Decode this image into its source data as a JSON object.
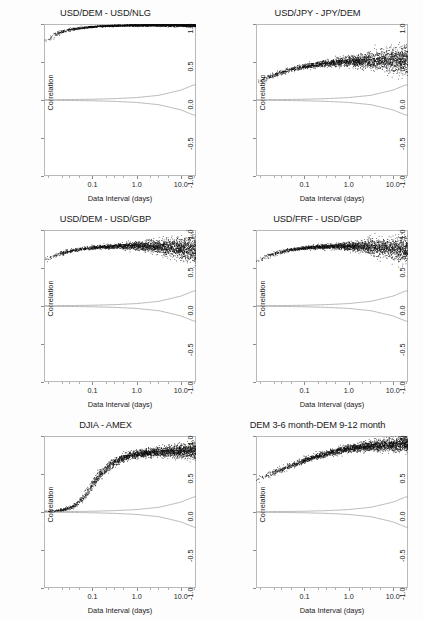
{
  "figure": {
    "background": "#fdfdfd",
    "point_color": "#0d0d0d",
    "band_color": "#9a9a9a",
    "layout": "3 rows x 2 columns"
  },
  "axes": {
    "xlabel": "Data Interval (days)",
    "ylabel": "Correlation",
    "x_scale": "log",
    "x_ticks": [
      {
        "value": 0.1,
        "label": "0.1"
      },
      {
        "value": 1.0,
        "label": "1.0"
      },
      {
        "value": 10.0,
        "label": "10.0"
      }
    ],
    "xlim": [
      0.008,
      22
    ],
    "y_ticks": [
      {
        "value": 1.0,
        "label": "1.0"
      },
      {
        "value": 0.5,
        "label": "0.5"
      },
      {
        "value": 0.0,
        "label": "0.0"
      },
      {
        "value": -0.5,
        "label": "-0.5"
      },
      {
        "value": -1.0,
        "label": "-1.0"
      }
    ],
    "ylim": [
      -1.0,
      1.0
    ],
    "grid": false,
    "legend": "none"
  },
  "chart_data": [
    {
      "type": "scatter",
      "title": "USD/DEM - USD/NLG",
      "xlabel": "Data Interval (days)",
      "ylabel": "Correlation",
      "xscale": "log",
      "xlim": [
        0.008,
        22
      ],
      "ylim": [
        -1.0,
        1.0
      ],
      "grid": false,
      "series": [
        {
          "name": "correlation",
          "x": [
            0.01,
            0.014,
            0.02,
            0.028,
            0.04,
            0.056,
            0.08,
            0.11,
            0.16,
            0.22,
            0.32,
            0.45,
            0.63,
            0.9,
            1.3,
            1.8,
            2.5,
            3.6,
            5.0,
            7.1,
            10.0,
            14.0,
            20.0
          ],
          "y": [
            0.8,
            0.855,
            0.893,
            0.918,
            0.936,
            0.949,
            0.958,
            0.965,
            0.97,
            0.974,
            0.977,
            0.979,
            0.981,
            0.982,
            0.983,
            0.984,
            0.985,
            0.985,
            0.986,
            0.986,
            0.986,
            0.986,
            0.986
          ],
          "spread": [
            0.035,
            0.028,
            0.022,
            0.018,
            0.014,
            0.012,
            0.01,
            0.009,
            0.008,
            0.008,
            0.008,
            0.008,
            0.009,
            0.009,
            0.01,
            0.011,
            0.012,
            0.013,
            0.014,
            0.016,
            0.018,
            0.02,
            0.022
          ]
        },
        {
          "name": "upper-confidence-band",
          "x": [
            0.01,
            0.032,
            0.1,
            0.32,
            1.0,
            3.2,
            10.0,
            20.0
          ],
          "y": [
            0.004,
            0.006,
            0.01,
            0.018,
            0.032,
            0.062,
            0.13,
            0.2
          ]
        },
        {
          "name": "lower-confidence-band",
          "x": [
            0.01,
            0.032,
            0.1,
            0.32,
            1.0,
            3.2,
            10.0,
            20.0
          ],
          "y": [
            -0.004,
            -0.006,
            -0.01,
            -0.018,
            -0.032,
            -0.062,
            -0.13,
            -0.2
          ]
        }
      ]
    },
    {
      "type": "scatter",
      "title": "USD/JPY - JPY/DEM",
      "xlabel": "Data Interval (days)",
      "ylabel": "Correlation",
      "xscale": "log",
      "xlim": [
        0.008,
        22
      ],
      "ylim": [
        -1.0,
        1.0
      ],
      "grid": false,
      "series": [
        {
          "name": "correlation",
          "x": [
            0.01,
            0.014,
            0.02,
            0.028,
            0.04,
            0.056,
            0.08,
            0.11,
            0.16,
            0.22,
            0.32,
            0.45,
            0.63,
            0.9,
            1.3,
            1.8,
            2.5,
            3.6,
            5.0,
            7.1,
            10.0,
            14.0,
            20.0
          ],
          "y": [
            0.25,
            0.29,
            0.325,
            0.356,
            0.383,
            0.407,
            0.428,
            0.445,
            0.46,
            0.472,
            0.482,
            0.49,
            0.497,
            0.502,
            0.506,
            0.51,
            0.513,
            0.516,
            0.519,
            0.522,
            0.525,
            0.528,
            0.53
          ],
          "spread": [
            0.03,
            0.028,
            0.027,
            0.026,
            0.026,
            0.026,
            0.027,
            0.028,
            0.03,
            0.033,
            0.036,
            0.04,
            0.045,
            0.051,
            0.058,
            0.066,
            0.075,
            0.085,
            0.096,
            0.108,
            0.12,
            0.133,
            0.145
          ]
        },
        {
          "name": "upper-confidence-band",
          "x": [
            0.01,
            0.032,
            0.1,
            0.32,
            1.0,
            3.2,
            10.0,
            20.0
          ],
          "y": [
            0.004,
            0.006,
            0.01,
            0.018,
            0.032,
            0.062,
            0.13,
            0.2
          ]
        },
        {
          "name": "lower-confidence-band",
          "x": [
            0.01,
            0.032,
            0.1,
            0.32,
            1.0,
            3.2,
            10.0,
            20.0
          ],
          "y": [
            -0.004,
            -0.006,
            -0.01,
            -0.018,
            -0.032,
            -0.062,
            -0.13,
            -0.2
          ]
        }
      ]
    },
    {
      "type": "scatter",
      "title": "USD/DEM - USD/GBP",
      "xlabel": "Data Interval (days)",
      "ylabel": "Correlation",
      "xscale": "log",
      "xlim": [
        0.008,
        22
      ],
      "ylim": [
        -1.0,
        1.0
      ],
      "grid": false,
      "series": [
        {
          "name": "correlation",
          "x": [
            0.01,
            0.014,
            0.02,
            0.028,
            0.04,
            0.056,
            0.08,
            0.11,
            0.16,
            0.22,
            0.32,
            0.45,
            0.63,
            0.9,
            1.3,
            1.8,
            2.5,
            3.6,
            5.0,
            7.1,
            10.0,
            14.0,
            20.0
          ],
          "y": [
            0.62,
            0.66,
            0.69,
            0.714,
            0.733,
            0.748,
            0.76,
            0.769,
            0.776,
            0.781,
            0.785,
            0.787,
            0.788,
            0.788,
            0.787,
            0.785,
            0.782,
            0.778,
            0.773,
            0.767,
            0.76,
            0.752,
            0.743
          ],
          "spread": [
            0.028,
            0.025,
            0.022,
            0.02,
            0.019,
            0.018,
            0.018,
            0.019,
            0.02,
            0.022,
            0.025,
            0.029,
            0.034,
            0.04,
            0.047,
            0.055,
            0.064,
            0.074,
            0.085,
            0.097,
            0.11,
            0.124,
            0.138
          ]
        },
        {
          "name": "upper-confidence-band",
          "x": [
            0.01,
            0.032,
            0.1,
            0.32,
            1.0,
            3.2,
            10.0,
            20.0
          ],
          "y": [
            0.004,
            0.006,
            0.01,
            0.018,
            0.032,
            0.062,
            0.13,
            0.2
          ]
        },
        {
          "name": "lower-confidence-band",
          "x": [
            0.01,
            0.032,
            0.1,
            0.32,
            1.0,
            3.2,
            10.0,
            20.0
          ],
          "y": [
            -0.004,
            -0.006,
            -0.01,
            -0.018,
            -0.032,
            -0.062,
            -0.13,
            -0.2
          ]
        }
      ]
    },
    {
      "type": "scatter",
      "title": "USD/FRF - USD/GBP",
      "xlabel": "Data Interval (days)",
      "ylabel": "Correlation",
      "xscale": "log",
      "xlim": [
        0.008,
        22
      ],
      "ylim": [
        -1.0,
        1.0
      ],
      "grid": false,
      "series": [
        {
          "name": "correlation",
          "x": [
            0.01,
            0.014,
            0.02,
            0.028,
            0.04,
            0.056,
            0.08,
            0.11,
            0.16,
            0.22,
            0.32,
            0.45,
            0.63,
            0.9,
            1.3,
            1.8,
            2.5,
            3.6,
            5.0,
            7.1,
            10.0,
            14.0,
            20.0
          ],
          "y": [
            0.61,
            0.652,
            0.684,
            0.709,
            0.729,
            0.745,
            0.757,
            0.766,
            0.773,
            0.778,
            0.781,
            0.783,
            0.784,
            0.784,
            0.783,
            0.781,
            0.778,
            0.774,
            0.769,
            0.763,
            0.756,
            0.748,
            0.739
          ],
          "spread": [
            0.03,
            0.027,
            0.024,
            0.022,
            0.02,
            0.019,
            0.019,
            0.02,
            0.021,
            0.023,
            0.026,
            0.03,
            0.035,
            0.041,
            0.048,
            0.056,
            0.065,
            0.075,
            0.086,
            0.098,
            0.111,
            0.125,
            0.14
          ]
        },
        {
          "name": "upper-confidence-band",
          "x": [
            0.01,
            0.032,
            0.1,
            0.32,
            1.0,
            3.2,
            10.0,
            20.0
          ],
          "y": [
            0.004,
            0.006,
            0.01,
            0.018,
            0.032,
            0.062,
            0.13,
            0.2
          ]
        },
        {
          "name": "lower-confidence-band",
          "x": [
            0.01,
            0.032,
            0.1,
            0.32,
            1.0,
            3.2,
            10.0,
            20.0
          ],
          "y": [
            -0.004,
            -0.006,
            -0.01,
            -0.018,
            -0.032,
            -0.062,
            -0.13,
            -0.2
          ]
        }
      ]
    },
    {
      "type": "scatter",
      "title": "DJIA - AMEX",
      "xlabel": "Data Interval (days)",
      "ylabel": "Correlation",
      "xscale": "log",
      "xlim": [
        0.008,
        22
      ],
      "ylim": [
        -1.0,
        1.0
      ],
      "grid": false,
      "series": [
        {
          "name": "correlation",
          "x": [
            0.01,
            0.014,
            0.02,
            0.028,
            0.04,
            0.056,
            0.08,
            0.11,
            0.16,
            0.22,
            0.32,
            0.45,
            0.63,
            0.9,
            1.3,
            1.8,
            2.5,
            3.6,
            5.0,
            7.1,
            10.0,
            14.0,
            20.0
          ],
          "y": [
            0.01,
            0.015,
            0.025,
            0.045,
            0.085,
            0.16,
            0.275,
            0.4,
            0.51,
            0.595,
            0.655,
            0.7,
            0.73,
            0.752,
            0.768,
            0.778,
            0.786,
            0.791,
            0.795,
            0.798,
            0.8,
            0.802,
            0.803
          ],
          "spread": [
            0.008,
            0.01,
            0.013,
            0.018,
            0.026,
            0.038,
            0.05,
            0.058,
            0.058,
            0.052,
            0.046,
            0.042,
            0.04,
            0.04,
            0.041,
            0.043,
            0.046,
            0.05,
            0.055,
            0.061,
            0.068,
            0.076,
            0.085
          ]
        },
        {
          "name": "upper-confidence-band",
          "x": [
            0.01,
            0.032,
            0.1,
            0.32,
            1.0,
            3.2,
            10.0,
            20.0
          ],
          "y": [
            0.004,
            0.006,
            0.01,
            0.018,
            0.032,
            0.062,
            0.13,
            0.2
          ]
        },
        {
          "name": "lower-confidence-band",
          "x": [
            0.01,
            0.032,
            0.1,
            0.32,
            1.0,
            3.2,
            10.0,
            20.0
          ],
          "y": [
            -0.004,
            -0.006,
            -0.01,
            -0.018,
            -0.032,
            -0.062,
            -0.13,
            -0.2
          ]
        }
      ]
    },
    {
      "type": "scatter",
      "title": "DEM 3-6 month-DEM 9-12 month",
      "xlabel": "Data Interval (days)",
      "ylabel": "Correlation",
      "xscale": "log",
      "xlim": [
        0.008,
        22
      ],
      "ylim": [
        -1.0,
        1.0
      ],
      "grid": false,
      "series": [
        {
          "name": "correlation",
          "x": [
            0.01,
            0.014,
            0.02,
            0.028,
            0.04,
            0.056,
            0.08,
            0.11,
            0.16,
            0.22,
            0.32,
            0.45,
            0.63,
            0.9,
            1.3,
            1.8,
            2.5,
            3.6,
            5.0,
            7.1,
            10.0,
            14.0,
            20.0
          ],
          "y": [
            0.44,
            0.478,
            0.515,
            0.55,
            0.585,
            0.62,
            0.655,
            0.688,
            0.718,
            0.744,
            0.768,
            0.79,
            0.808,
            0.824,
            0.838,
            0.85,
            0.86,
            0.868,
            0.875,
            0.881,
            0.886,
            0.89,
            0.893
          ],
          "spread": [
            0.035,
            0.034,
            0.033,
            0.032,
            0.032,
            0.031,
            0.031,
            0.031,
            0.031,
            0.032,
            0.033,
            0.034,
            0.036,
            0.038,
            0.041,
            0.044,
            0.048,
            0.052,
            0.057,
            0.062,
            0.068,
            0.074,
            0.08
          ]
        },
        {
          "name": "upper-confidence-band",
          "x": [
            0.01,
            0.032,
            0.1,
            0.32,
            1.0,
            3.2,
            10.0,
            20.0
          ],
          "y": [
            0.004,
            0.006,
            0.01,
            0.018,
            0.032,
            0.062,
            0.13,
            0.2
          ]
        },
        {
          "name": "lower-confidence-band",
          "x": [
            0.01,
            0.032,
            0.1,
            0.32,
            1.0,
            3.2,
            10.0,
            20.0
          ],
          "y": [
            -0.004,
            -0.006,
            -0.01,
            -0.018,
            -0.032,
            -0.062,
            -0.13,
            -0.2
          ]
        }
      ]
    }
  ]
}
